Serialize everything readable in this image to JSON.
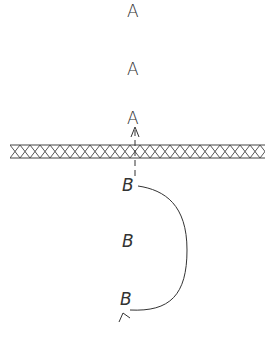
{
  "diagram": {
    "region_above": {
      "letters": [
        {
          "label": "A",
          "x": 122,
          "y": 3
        },
        {
          "label": "A",
          "x": 122,
          "y": 62
        },
        {
          "label": "A",
          "x": 122,
          "y": 111
        }
      ]
    },
    "barrier": {
      "style": "cross-hatched",
      "x_start": 10,
      "x_end": 265,
      "y_top": 145,
      "y_bottom": 158
    },
    "region_below": {
      "letters": [
        {
          "label": "B",
          "x": 122,
          "y": 178
        },
        {
          "label": "B",
          "x": 122,
          "y": 233
        },
        {
          "label": "B",
          "x": 120,
          "y": 291
        }
      ]
    },
    "arrows": [
      {
        "type": "dashed",
        "from": "B (top)",
        "to": "A (bottom)",
        "direction": "up",
        "crosses_barrier": true
      },
      {
        "type": "curved",
        "from": "B (top)",
        "to": "B (bottom)",
        "direction": "loop-right-and-down"
      }
    ],
    "colors": {
      "ink": "#333333",
      "background": "#ffffff"
    }
  }
}
